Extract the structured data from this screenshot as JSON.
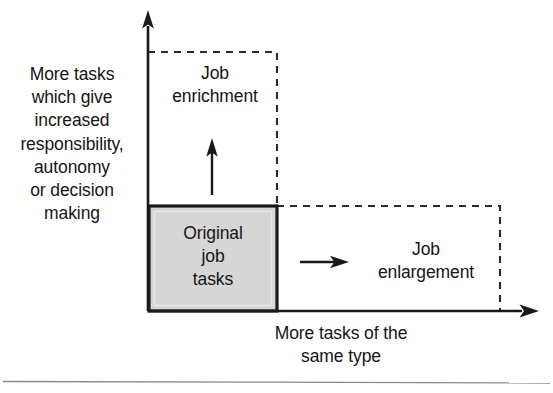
{
  "figure": {
    "background_color": "#ffffff",
    "line_color": "#1a1a1a",
    "box_fill_color": "#d6d6d6",
    "box_border_color": "#1a1a1a",
    "dashed_color": "#2b2b2b",
    "rule_color": "#808080"
  },
  "axes": {
    "y": {
      "label": "More tasks\nwhich give\nincreased\nresponsibility,\nautonomy\nor decision\nmaking",
      "direction": "up",
      "arrow": "arrow-up-icon"
    },
    "x": {
      "label": "More tasks of the\nsame type",
      "direction": "right",
      "arrow": "arrow-right-icon"
    }
  },
  "regions": {
    "origin_box": {
      "label": "Original\njob\ntasks",
      "style": "solid-filled"
    },
    "enrichment": {
      "label": "Job\nenrichment",
      "style": "dashed-outline",
      "growth_arrow": "arrow-up-icon"
    },
    "enlargement": {
      "label": "Job\nenlargement",
      "style": "dashed-outline",
      "growth_arrow": "arrow-right-icon"
    }
  }
}
